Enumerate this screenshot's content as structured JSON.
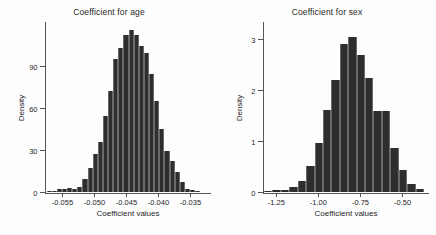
{
  "figure": {
    "background": "#fdfdfd",
    "bar_color": "#2e2e2e",
    "axis_color": "#555555"
  },
  "chart_data": [
    {
      "type": "bar",
      "title": "Coefficient for age",
      "xlabel": "Coefficient values",
      "ylabel": "Density",
      "xlim": [
        -0.0575,
        -0.0325
      ],
      "ylim": [
        0,
        120
      ],
      "grid": false,
      "legend": null,
      "xticks": [
        -0.055,
        -0.05,
        -0.045,
        -0.04,
        -0.035
      ],
      "xtick_labels": [
        "-0.055",
        "-0.050",
        "-0.045",
        "-0.040",
        "-0.035"
      ],
      "yticks": [
        0,
        30,
        60,
        90
      ],
      "ytick_labels": [
        "0",
        "30",
        "60",
        "90"
      ],
      "bin_width": 0.0008,
      "bin_centers": [
        -0.057,
        -0.0562,
        -0.0554,
        -0.0546,
        -0.0538,
        -0.053,
        -0.0522,
        -0.0514,
        -0.0506,
        -0.0498,
        -0.049,
        -0.0482,
        -0.0474,
        -0.0466,
        -0.0458,
        -0.045,
        -0.0442,
        -0.0434,
        -0.0426,
        -0.0418,
        -0.041,
        -0.0402,
        -0.0394,
        -0.0386,
        -0.0378,
        -0.037,
        -0.0362,
        -0.0354,
        -0.0346,
        -0.0338
      ],
      "values": [
        0.5,
        1,
        2,
        2.5,
        3,
        2.5,
        3.5,
        9,
        17,
        27,
        36,
        54,
        72,
        95,
        103,
        112,
        116,
        112,
        104,
        99,
        84,
        65,
        45,
        29,
        22,
        14,
        7,
        2.5,
        1.5,
        0.7
      ]
    },
    {
      "type": "bar",
      "title": "Coefficient for sex",
      "xlabel": "Coefficient values",
      "ylabel": "Density",
      "xlim": [
        -1.32,
        -0.37
      ],
      "ylim": [
        0,
        3.3
      ],
      "grid": false,
      "legend": null,
      "xticks": [
        -1.25,
        -1.0,
        -0.75,
        -0.5
      ],
      "xtick_labels": [
        "-1.25",
        "-1.00",
        "-0.75",
        "-0.50"
      ],
      "yticks": [
        0,
        1,
        2,
        3
      ],
      "ytick_labels": [
        "0",
        "1",
        "2",
        "3"
      ],
      "bin_width": 0.05,
      "bin_centers": [
        -1.295,
        -1.245,
        -1.195,
        -1.145,
        -1.095,
        -1.045,
        -0.995,
        -0.945,
        -0.895,
        -0.845,
        -0.795,
        -0.745,
        -0.695,
        -0.645,
        -0.595,
        -0.545,
        -0.495,
        -0.445,
        -0.395
      ],
      "values": [
        0.02,
        0.03,
        0.04,
        0.09,
        0.22,
        0.52,
        0.97,
        1.61,
        2.2,
        2.91,
        3.05,
        2.69,
        2.24,
        1.6,
        1.59,
        0.87,
        0.43,
        0.16,
        0.06
      ]
    }
  ]
}
